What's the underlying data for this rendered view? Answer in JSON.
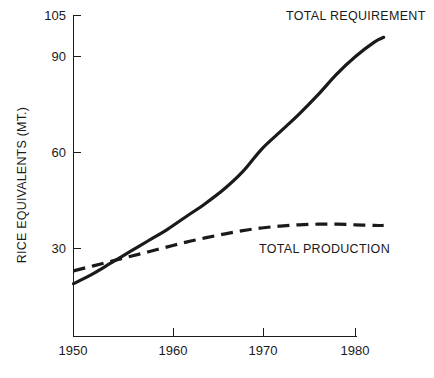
{
  "chart_data": {
    "type": "line",
    "title": "",
    "xlabel": "",
    "ylabel": "RICE EQUIVALENTS (MT.)",
    "xlim": [
      1950,
      1983
    ],
    "ylim": [
      0,
      105
    ],
    "grid": false,
    "legend_position": "inline-annotation",
    "xticks": [
      1950,
      1960,
      1970,
      1980
    ],
    "xtick_labels": [
      "1950",
      "1960",
      "1970",
      "1980"
    ],
    "yticks": [
      30,
      60,
      90,
      105
    ],
    "ytick_labels": [
      "30",
      "60",
      "90",
      "105"
    ],
    "series": [
      {
        "name": "TOTAL REQUIREMENT",
        "style": "solid",
        "x": [
          1950,
          1952,
          1954,
          1956,
          1958,
          1960,
          1962,
          1964,
          1966,
          1968,
          1970,
          1972,
          1974,
          1976,
          1978,
          1980,
          1982,
          1983
        ],
        "values": [
          19,
          22,
          25.5,
          29,
          32.5,
          36,
          40,
          44,
          48.5,
          54,
          61,
          66.5,
          72,
          78,
          84.5,
          90,
          94.5,
          96
        ]
      },
      {
        "name": "TOTAL PRODUCTION",
        "style": "dashed",
        "x": [
          1950,
          1952,
          1954,
          1956,
          1958,
          1960,
          1962,
          1964,
          1966,
          1968,
          1970,
          1972,
          1974,
          1976,
          1978,
          1980,
          1982,
          1983
        ],
        "values": [
          23,
          24.5,
          26,
          27.5,
          29,
          30.5,
          32,
          33.3,
          34.5,
          35.6,
          36.4,
          37,
          37.4,
          37.6,
          37.6,
          37.4,
          37.2,
          37.2
        ]
      }
    ],
    "annotations": [
      {
        "name": "total-requirement-label",
        "text": "TOTAL REQUIREMENT"
      },
      {
        "name": "total-production-label",
        "text": "TOTAL PRODUCTION"
      }
    ],
    "colors": {
      "line": "#1a1a1a",
      "axis": "#1a1a1a",
      "background": "#ffffff"
    }
  }
}
